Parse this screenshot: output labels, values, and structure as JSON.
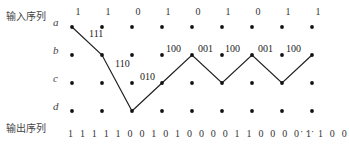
{
  "labels": {
    "input_sequence": "输入序列",
    "output_sequence": "输出序列"
  },
  "input_bits": [
    "1",
    "1",
    "0",
    "1",
    "0",
    "1",
    "0",
    "1",
    "1"
  ],
  "states": [
    "a",
    "b",
    "c",
    "d"
  ],
  "grid": {
    "columns_x": [
      72,
      102,
      132,
      162,
      192,
      222,
      252,
      282,
      312
    ],
    "rows_y": [
      27,
      55,
      83,
      111
    ]
  },
  "path": [
    {
      "col": 0,
      "row": 0
    },
    {
      "col": 1,
      "row": 1
    },
    {
      "col": 2,
      "row": 3
    },
    {
      "col": 3,
      "row": 2
    },
    {
      "col": 4,
      "row": 1
    },
    {
      "col": 5,
      "row": 2
    },
    {
      "col": 6,
      "row": 1
    },
    {
      "col": 7,
      "row": 2
    },
    {
      "col": 8,
      "row": 1
    }
  ],
  "edge_labels": [
    {
      "text": "111",
      "x": 89,
      "y": 34
    },
    {
      "text": "110",
      "x": 115,
      "y": 64
    },
    {
      "text": "010",
      "x": 140,
      "y": 77
    },
    {
      "text": "100",
      "x": 166,
      "y": 49
    },
    {
      "text": "001",
      "x": 198,
      "y": 49
    },
    {
      "text": "100",
      "x": 225,
      "y": 49
    },
    {
      "text": "001",
      "x": 258,
      "y": 49
    },
    {
      "text": "100",
      "x": 286,
      "y": 49
    }
  ],
  "output_sequence": "1 1 1 1 1 0 0 1 0 1 0 0 0 0 1 1 0 0 0 0 1 1 0 0",
  "ellipsis": "···"
}
